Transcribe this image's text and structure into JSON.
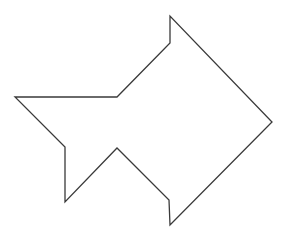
{
  "diagram": {
    "kind": "polygon-outline",
    "stroke_color": "#3a3a3a",
    "fill_color": "#ffffff",
    "stroke_width": 1.3,
    "points": "170,16 170,43 117,97 15,97 65,147 65,202 117,148 169,200 170,225 272,122"
  }
}
